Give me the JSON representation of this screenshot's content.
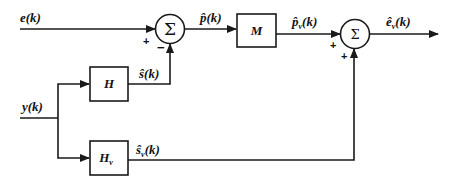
{
  "diagram": {
    "type": "block-diagram",
    "colors": {
      "stroke": "#1a1a1a",
      "background": "#ffffff"
    },
    "inputs": [
      {
        "id": "e",
        "label": "e(k)"
      },
      {
        "id": "y",
        "label": "y(k)"
      }
    ],
    "blocks": [
      {
        "id": "H",
        "label": "H"
      },
      {
        "id": "M",
        "label": "M"
      },
      {
        "id": "Hv",
        "label": "H",
        "subscript": "v"
      }
    ],
    "summers": [
      {
        "id": "sum1",
        "symbol": "Σ",
        "signs": {
          "left": "+",
          "bottom": "−"
        }
      },
      {
        "id": "sum2",
        "symbol": "Σ",
        "signs": {
          "left": "+",
          "bottom": "+"
        }
      }
    ],
    "signals": [
      {
        "id": "s_hat",
        "label": "ŝ(k)"
      },
      {
        "id": "p_hat",
        "label": "p̂(k)"
      },
      {
        "id": "pv_hat",
        "label": "p̂",
        "subscript": "v",
        "suffix": "(k)"
      },
      {
        "id": "sv_hat",
        "label": "ŝ",
        "subscript": "v",
        "suffix": "(k)"
      },
      {
        "id": "ev_hat",
        "label": "ê",
        "subscript": "v",
        "suffix": "(k)"
      }
    ],
    "connections": [
      "e(k) → Σ1 (+)",
      "y(k) → H → ŝ(k) → Σ1 (−)",
      "Σ1 → p̂(k) → M → p̂v(k) → Σ2 (+)",
      "y(k) → Hv → ŝv(k) → Σ2 (+)",
      "Σ2 → êv(k)"
    ]
  }
}
